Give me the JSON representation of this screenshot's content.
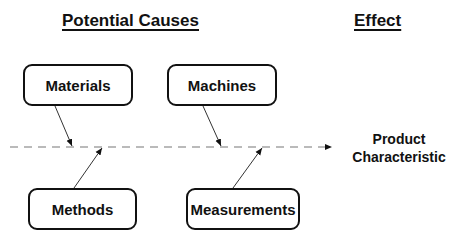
{
  "headings": {
    "causes": "Potential Causes",
    "effect": "Effect"
  },
  "causes": [
    {
      "label": "Materials"
    },
    {
      "label": "Machines"
    },
    {
      "label": "Methods"
    },
    {
      "label": "Measurements"
    }
  ],
  "effect": {
    "line1": "Product",
    "line2": "Characteristic"
  }
}
